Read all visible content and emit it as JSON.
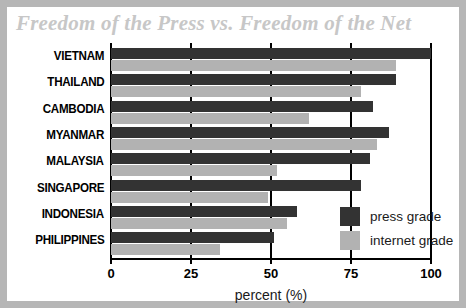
{
  "chart_data": {
    "type": "bar",
    "orientation": "horizontal",
    "title": "Freedom of the Press vs. Freedom of the Net",
    "xlabel": "percent (%)",
    "ylabel": "",
    "xlim": [
      0,
      100
    ],
    "xticks": [
      0,
      25,
      50,
      75,
      100
    ],
    "xtick_labels": [
      "0",
      "25",
      "50",
      "75",
      "100"
    ],
    "grid": "vertical",
    "legend_position": "inside-bottom-right",
    "categories": [
      "VIETNAM",
      "THAILAND",
      "CAMBODIA",
      "MYANMAR",
      "MALAYSIA",
      "SINGAPORE",
      "INDONESIA",
      "PHILIPPINES"
    ],
    "series": [
      {
        "name": "press grade",
        "color": "#333333",
        "values": [
          100,
          89,
          82,
          87,
          81,
          78,
          58,
          51
        ]
      },
      {
        "name": "internet grade",
        "color": "#b2b2b2",
        "values": [
          89,
          78,
          62,
          83,
          52,
          49,
          55,
          34
        ]
      }
    ]
  },
  "legend": {
    "items": [
      {
        "label": "press grade",
        "swatch": "press"
      },
      {
        "label": "internet grade",
        "swatch": "internet"
      }
    ]
  },
  "colors": {
    "press_grade": "#333333",
    "internet_grade": "#b2b2b2",
    "title": "#c7c7c7",
    "frame": "#b6b6b6",
    "axis": "#000000",
    "background": "#ffffff"
  }
}
